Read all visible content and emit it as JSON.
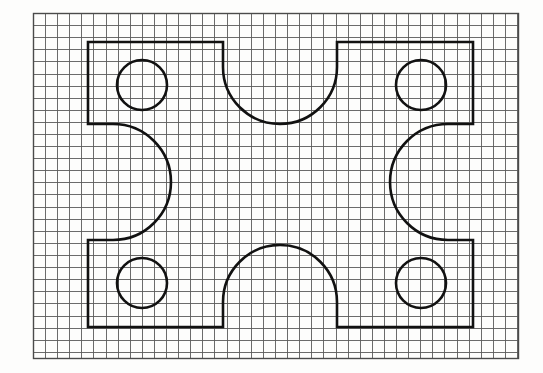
{
  "document": {
    "kind": "engineering-sketch",
    "medium": "graph-paper",
    "title": "Symmetric plate outline with four bores and four arc cut-outs"
  },
  "canvas": {
    "width": 543,
    "height": 373,
    "background_color": "#fdfdfc"
  },
  "grid": {
    "label": "graph-paper-grid",
    "line_color": "#5a5a5a",
    "border_color": "#4a4a4a",
    "line_width": 0.9,
    "border_width": 1.4,
    "cell_size": 12.1,
    "origin_x": 33,
    "origin_y": 13,
    "right": 518,
    "bottom": 358,
    "columns": 40,
    "rows": 28.5
  },
  "figure": {
    "label": "plate-outline",
    "stroke_color": "#111111",
    "stroke_width": 2.6,
    "fill": "none",
    "bounds": {
      "left": 88,
      "right": 473,
      "top": 42,
      "bottom": 327,
      "width": 385,
      "height": 285
    },
    "shoulder_top_y": 124,
    "shoulder_bottom_y": 240,
    "notch_left_x": 223,
    "notch_right_x": 337,
    "path": "M 88 42 L 223 42 L 223 67 A 57 57 0 0 0 337 67 L 337 42 L 473 42 L 473 124 L 448 124 A 58 58 0 0 0 448 240 L 473 240 L 473 327 L 337 327 L 337 302 A 57 57 0 0 0 223 302 L 223 327 L 88 327 L 88 240 L 113 240 A 58 58 0 0 0 113 124 L 88 124 Z"
  },
  "features": {
    "bores": [
      {
        "name": "bore-top-left",
        "cx": 142,
        "cy": 85,
        "r": 25
      },
      {
        "name": "bore-top-right",
        "cx": 421,
        "cy": 85,
        "r": 25
      },
      {
        "name": "bore-bottom-left",
        "cx": 142,
        "cy": 283,
        "r": 25
      },
      {
        "name": "bore-bottom-right",
        "cx": 421,
        "cy": 283,
        "r": 25
      }
    ],
    "arcs": [
      {
        "name": "notch-top-center",
        "type": "concave-semicircle",
        "orientation": "opens-up",
        "cx": 280,
        "cy": 67,
        "r": 57
      },
      {
        "name": "notch-bottom-center",
        "type": "concave-semicircle",
        "orientation": "opens-down",
        "cx": 280,
        "cy": 302,
        "r": 57
      },
      {
        "name": "notch-left-side",
        "type": "concave-semicircle",
        "orientation": "opens-left",
        "cx": 88,
        "cy": 182,
        "r": 58
      },
      {
        "name": "notch-right-side",
        "type": "concave-semicircle",
        "orientation": "opens-right",
        "cx": 473,
        "cy": 182,
        "r": 58
      }
    ]
  }
}
